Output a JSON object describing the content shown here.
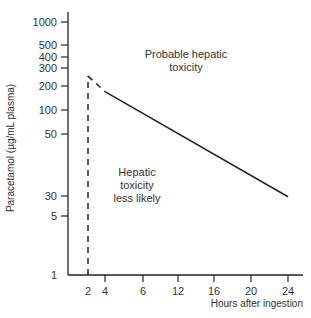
{
  "chart_data": {
    "type": "line",
    "title": "",
    "xlabel": "Hours after ingestion",
    "ylabel": "Paracetamol (µg/mL plasma)",
    "x_ticks": [
      2,
      4,
      6,
      12,
      16,
      20,
      24
    ],
    "y_ticks": [
      1000,
      500,
      400,
      300,
      200,
      100,
      50,
      30,
      5,
      1
    ],
    "y_scale": "non-linear (as printed)",
    "grid": false,
    "series": [
      {
        "name": "treatment line",
        "style": "solid",
        "x": [
          4,
          24
        ],
        "y": [
          170,
          28
        ]
      },
      {
        "name": "treatment line extension",
        "style": "dashed",
        "x": [
          2,
          4
        ],
        "y": [
          250,
          170
        ]
      },
      {
        "name": "2-hour marker",
        "style": "dashed",
        "x": [
          2,
          2
        ],
        "y": [
          1,
          250
        ]
      }
    ],
    "annotations": [
      {
        "text_lines": [
          "Probable hepatic",
          "toxicity"
        ],
        "region": "above line"
      },
      {
        "text_lines": [
          "Hepatic",
          "toxicity",
          "less likely"
        ],
        "region": "below line"
      }
    ]
  }
}
